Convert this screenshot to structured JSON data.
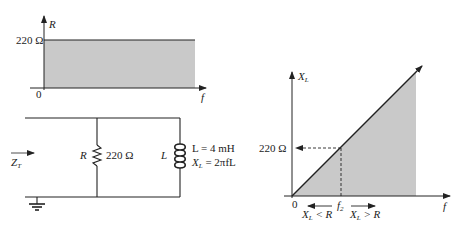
{
  "colors": {
    "ink": "#222222",
    "fill": "#c9c9c9",
    "background": "#ffffff"
  },
  "resistance_plot": {
    "y_axis_label": "R",
    "x_axis_label": "f",
    "origin_label": "0",
    "level_label": "220 Ω"
  },
  "circuit": {
    "input_label_main": "Z",
    "input_label_sub": "T",
    "resistor_name": "R",
    "resistor_value": "220 Ω",
    "inductor_name": "L",
    "inductor_eq1": "L = 4 mH",
    "inductor_eq2_main": "X",
    "inductor_eq2_sub": "L",
    "inductor_eq2_rest": " = 2πfL"
  },
  "reactance_plot": {
    "y_axis_label_main": "X",
    "y_axis_label_sub": "L",
    "x_axis_label": "f",
    "origin_label": "0",
    "level_label": "220 Ω",
    "crossover_main": "f",
    "crossover_sub": "2",
    "left_region_main": "X",
    "left_region_sub": "L",
    "left_region_rest": " < R",
    "right_region_main": "X",
    "right_region_sub": "L",
    "right_region_rest": " > R"
  }
}
